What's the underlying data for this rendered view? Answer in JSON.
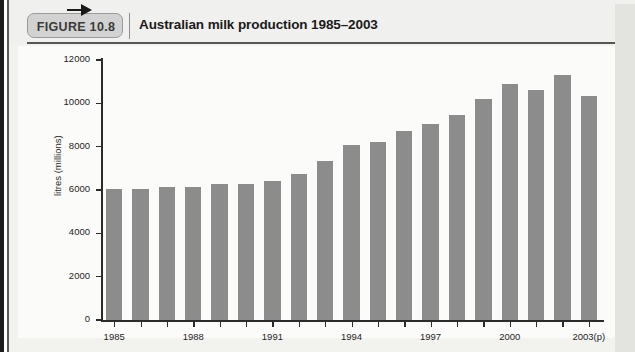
{
  "figure": {
    "badge_label": "FIGURE 10.8",
    "title": "Australian milk production 1985–2003"
  },
  "chart_data": {
    "type": "bar",
    "title": "Australian milk production 1985–2003",
    "xlabel": "",
    "ylabel": "litres (millions)",
    "ylim": [
      0,
      12000
    ],
    "ytick_values": [
      0,
      2000,
      4000,
      6000,
      8000,
      10000,
      12000
    ],
    "ytick_labels": [
      "0",
      "2000",
      "4000",
      "6000",
      "8000",
      "10000",
      "12000"
    ],
    "grid": false,
    "legend": "none",
    "bar_color": "#8c8c8c",
    "categories": [
      "1985",
      "1986",
      "1987",
      "1988",
      "1989",
      "1990",
      "1991",
      "1992",
      "1993",
      "1994",
      "1995",
      "1996",
      "1997",
      "1998",
      "1999",
      "2000",
      "2001",
      "2002",
      "2003(p)"
    ],
    "xtick_labels": [
      "1985",
      "",
      "",
      "1988",
      "",
      "",
      "1991",
      "",
      "",
      "1994",
      "",
      "",
      "1997",
      "",
      "",
      "2000",
      "",
      "",
      "2003(p)"
    ],
    "values": [
      6050,
      6030,
      6120,
      6130,
      6300,
      6280,
      6400,
      6740,
      7330,
      8080,
      8210,
      8720,
      9030,
      9450,
      10200,
      10900,
      10600,
      11300,
      10350
    ]
  }
}
